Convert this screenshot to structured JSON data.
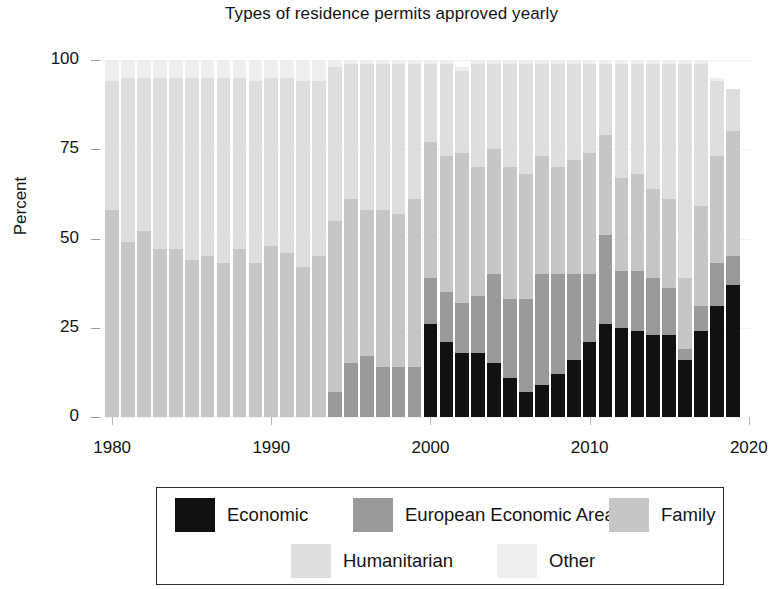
{
  "chart_data": {
    "type": "bar",
    "subtype": "stacked-percent",
    "title": "Types of residence permits approved yearly",
    "xlabel": "",
    "ylabel": "Percent",
    "ylim": [
      0,
      100
    ],
    "yticks": [
      0,
      25,
      50,
      75,
      100
    ],
    "ytick_labels": [
      "0",
      "25",
      "50",
      "75",
      "100"
    ],
    "xticks": [
      1980,
      1990,
      2000,
      2010,
      2020
    ],
    "xtick_labels": [
      "1980",
      "1990",
      "2000",
      "2010",
      "2020"
    ],
    "xlim": [
      1979.3,
      2020.2
    ],
    "grid": false,
    "legend_position": "below",
    "colors": {
      "Economic": "#111111",
      "European Economic Area": "#9a9a9a",
      "Family": "#c6c6c6",
      "Humanitarian": "#dedede",
      "Other": "#eeeeee"
    },
    "categories": [
      1980,
      1981,
      1982,
      1983,
      1984,
      1985,
      1986,
      1987,
      1988,
      1989,
      1990,
      1991,
      1992,
      1993,
      1994,
      1995,
      1996,
      1997,
      1998,
      1999,
      2000,
      2001,
      2002,
      2003,
      2004,
      2005,
      2006,
      2007,
      2008,
      2009,
      2010,
      2011,
      2012,
      2013,
      2014,
      2015,
      2016,
      2017,
      2018,
      2019
    ],
    "series": [
      {
        "name": "Economic",
        "values": [
          0,
          0,
          0,
          0,
          0,
          0,
          0,
          0,
          0,
          0,
          0,
          0,
          0,
          0,
          0,
          0,
          0,
          0,
          0,
          0,
          26,
          21,
          18,
          18,
          15,
          11,
          7,
          9,
          12,
          16,
          21,
          26,
          25,
          24,
          23,
          23,
          16,
          24,
          31,
          37
        ]
      },
      {
        "name": "European Economic Area",
        "values": [
          0,
          0,
          0,
          0,
          0,
          0,
          0,
          0,
          0,
          0,
          0,
          0,
          0,
          0,
          7,
          15,
          17,
          14,
          14,
          14,
          13,
          14,
          14,
          16,
          25,
          22,
          26,
          31,
          28,
          24,
          19,
          25,
          16,
          17,
          16,
          13,
          3,
          7,
          12,
          8
        ]
      },
      {
        "name": "Family",
        "values": [
          58,
          49,
          52,
          47,
          47,
          44,
          45,
          43,
          47,
          43,
          48,
          46,
          42,
          45,
          48,
          46,
          41,
          44,
          43,
          47,
          38,
          38,
          42,
          36,
          35,
          37,
          35,
          33,
          30,
          32,
          34,
          28,
          26,
          27,
          25,
          25,
          20,
          28,
          30,
          35
        ]
      },
      {
        "name": "Humanitarian",
        "values": [
          36,
          46,
          43,
          48,
          48,
          51,
          50,
          52,
          48,
          51,
          47,
          49,
          52,
          49,
          43,
          38,
          41,
          41,
          42,
          38,
          22,
          26,
          23,
          29,
          24,
          29,
          31,
          26,
          29,
          27,
          25,
          20,
          32,
          31,
          35,
          38,
          60,
          40,
          21,
          12
        ]
      },
      {
        "name": "Other",
        "values": [
          6,
          5,
          5,
          5,
          5,
          5,
          5,
          5,
          5,
          6,
          5,
          5,
          6,
          6,
          2,
          1,
          1,
          1,
          1,
          1,
          1,
          1,
          1,
          1,
          1,
          1,
          1,
          1,
          1,
          1,
          1,
          1,
          1,
          1,
          1,
          1,
          1,
          1,
          1,
          0
        ]
      }
    ]
  },
  "legend": {
    "items": [
      {
        "label": "Economic",
        "color": "#111111"
      },
      {
        "label": "European Economic Area",
        "color": "#9a9a9a"
      },
      {
        "label": "Family",
        "color": "#c6c6c6"
      },
      {
        "label": "Humanitarian",
        "color": "#dedede"
      },
      {
        "label": "Other",
        "color": "#eeeeee"
      }
    ]
  }
}
